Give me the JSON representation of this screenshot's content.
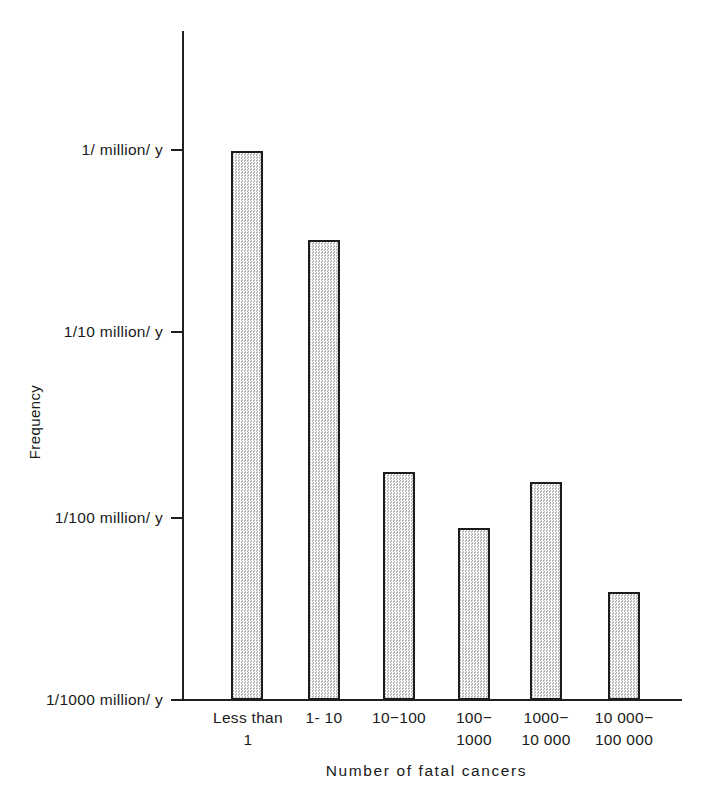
{
  "chart_data": {
    "type": "bar",
    "title": "",
    "subtitle": "",
    "xlabel": "Number of fatal cancers",
    "ylabel": "Frequency",
    "yscale": "log",
    "ylim": [
      1e-09,
      3e-06
    ],
    "grid": false,
    "legend": null,
    "categories": [
      "Less than\n1",
      "1- 10",
      "10−100",
      "100−\n1000",
      "1000−\n10 000",
      "10 000−\n100 000"
    ],
    "ytick_labels": [
      "1/ million/ y",
      "1/10  million/ y",
      "1/100  million/ y",
      "1/1000  million/ y"
    ],
    "ytick_values": [
      1e-06,
      1e-07,
      1e-08,
      1e-09
    ],
    "values": [
      9.9e-07,
      3.3e-07,
      1.8e-08,
      8.8e-09,
      1.6e-08,
      4e-09
    ],
    "value_labels": [
      "~1/million/y",
      "~3/10 million/y",
      "~1.8/100 million/y",
      "~9/1000 million/y",
      "~1.6/100 million/y",
      "~4/1000 million/y"
    ],
    "colors": {
      "bar_fill": "#e3e3e3",
      "bar_edge": "#1c1c1c",
      "axis": "#1f1f1f",
      "text": "#1a1a1a",
      "background": "#ffffff"
    }
  },
  "axis": {
    "y_title": "Frequency",
    "x_title": "Number of fatal cancers"
  },
  "yticks": [
    {
      "label": "1/ million/ y",
      "top": 150
    },
    {
      "label": "1/10  million/ y",
      "top": 332
    },
    {
      "label": "1/100  million/ y",
      "top": 518
    },
    {
      "label": "1/1000  million/ y",
      "top": 700
    }
  ],
  "bars": [
    {
      "label": "Less than\n1",
      "left": 231,
      "width": 32,
      "top": 151,
      "label_left": 196,
      "label_width": 104
    },
    {
      "label": "1- 10",
      "left": 308,
      "width": 32,
      "top": 240,
      "label_left": 272,
      "label_width": 104
    },
    {
      "label": "10−100",
      "left": 383,
      "width": 32,
      "top": 472,
      "label_left": 347,
      "label_width": 104
    },
    {
      "label": "100−\n1000",
      "left": 458,
      "width": 32,
      "top": 528,
      "label_left": 422,
      "label_width": 104
    },
    {
      "label": "1000−\n10 000",
      "left": 530,
      "width": 32,
      "top": 482,
      "label_left": 494,
      "label_width": 104
    },
    {
      "label": "10 000−\n100 000",
      "left": 608,
      "width": 32,
      "top": 592,
      "label_left": 568,
      "label_width": 112
    }
  ]
}
